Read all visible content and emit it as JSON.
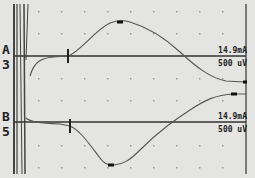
{
  "display": {
    "background": "#e4e4e2",
    "trace_color": "#555555",
    "baseline_color": "#333333",
    "grid_dot_color": "#9a9a9a"
  },
  "channels": [
    {
      "id": "A",
      "label": "A",
      "number": "3",
      "stimulus": "14.9mA",
      "sensitivity": "500 uV",
      "baseline_y": 56,
      "onset_marker_x": 68,
      "peak_marker": {
        "x": 120,
        "y": 22
      },
      "end_marker": {
        "x": 243,
        "y": 82
      }
    },
    {
      "id": "B",
      "label": "B",
      "number": "5",
      "stimulus": "14.9mA",
      "sensitivity": "500 uV",
      "baseline_y": 122,
      "onset_marker_x": 70,
      "peak_marker": {
        "x": 111,
        "y": 165
      },
      "end_marker": {
        "x": 234,
        "y": 94
      }
    }
  ]
}
